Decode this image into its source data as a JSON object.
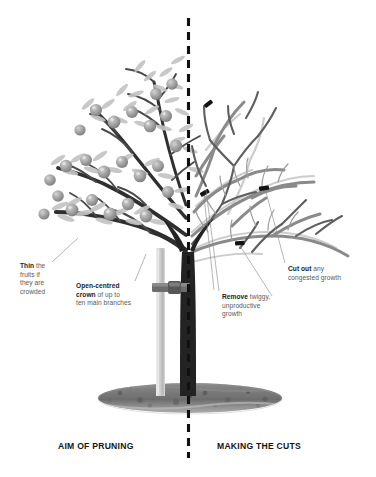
{
  "figure": {
    "title_left": "AIM OF PRUNING",
    "title_right": "MAKING THE CUTS",
    "background": "#ffffff",
    "divider_color": "#111111",
    "ink_dark": "#1c1c1c",
    "ink_body": "#5a5a5a",
    "branch_dark": "#2b2b2b",
    "branch_light": "#8e8e8e",
    "branch_faint": "#c9c9c9",
    "fruit_color": "#9a9a9a",
    "leaf_color": "#c2c2c2",
    "soil_color": "#6f6f6f",
    "stake_color": "#c6c6c6",
    "cut_mark_color": "#1a1a1a"
  },
  "captions": [
    {
      "id": "aim-of-pruning",
      "text": "AIM OF PRUNING",
      "x": 58,
      "y": 443
    },
    {
      "id": "making-the-cuts",
      "text": "MAKING THE CUTS",
      "x": 217,
      "y": 443
    }
  ],
  "labels": [
    {
      "id": "thin-fruits",
      "x": 20,
      "y": 262,
      "lines": [
        {
          "bold": "Thin",
          "rest": " the"
        },
        {
          "bold": "",
          "rest": "fruits if"
        },
        {
          "bold": "",
          "rest": "they are"
        },
        {
          "bold": "",
          "rest": "crowded"
        }
      ],
      "leader": {
        "x1": 52,
        "y1": 262,
        "x2": 78,
        "y2": 238
      }
    },
    {
      "id": "open-centred-crown",
      "x": 76,
      "y": 282,
      "lines": [
        {
          "bold": "Open-centred",
          "rest": ""
        },
        {
          "bold": "crown",
          "rest": " of up to"
        },
        {
          "bold": "",
          "rest": "ten main branches"
        }
      ],
      "leader": {
        "x1": 135,
        "y1": 281,
        "x2": 146,
        "y2": 254
      }
    },
    {
      "id": "remove-twiggy-growth",
      "x": 222,
      "y": 293,
      "lines": [
        {
          "bold": "Remove",
          "rest": " twiggy,"
        },
        {
          "bold": "",
          "rest": "unproductive"
        },
        {
          "bold": "",
          "rest": "growth"
        }
      ],
      "leader": {
        "x1": 219,
        "y1": 291,
        "x2": 206,
        "y2": 188
      }
    },
    {
      "id": "cut-out-congested-growth",
      "x": 288,
      "y": 265,
      "lines": [
        {
          "bold": "Cut out",
          "rest": " any"
        },
        {
          "bold": "",
          "rest": "congested growth"
        }
      ],
      "leader": {
        "x1": 285,
        "y1": 263,
        "x2": 265,
        "y2": 190
      }
    }
  ],
  "annotations": {
    "cut_marks": [
      {
        "id": "cut-mark-upper-left",
        "x": 208,
        "y": 106,
        "angle": -38
      },
      {
        "id": "cut-mark-mid-left",
        "x": 204,
        "y": 193,
        "angle": -30
      },
      {
        "id": "cut-mark-mid-right",
        "x": 264,
        "y": 188,
        "angle": -8
      },
      {
        "id": "cut-mark-lower",
        "x": 240,
        "y": 243,
        "angle": -4
      }
    ]
  },
  "scene": {
    "left_panel": "leafy fruit tree with ripe fruits",
    "right_panel": "bare pruned tree with cut marks",
    "ground": "soil mound at base",
    "stake": "vertical tree stake with tie"
  }
}
